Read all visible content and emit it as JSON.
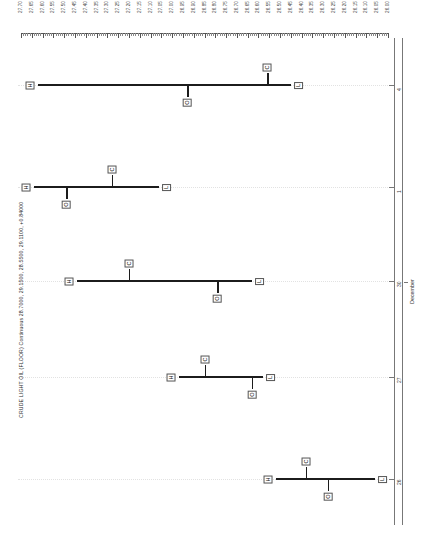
{
  "series_title": "CRUDE LIGHT OIL (FLOOR) Continuous 28.7000, 29.1500, 28.5500, 29.1100, +0.84000",
  "orientation": "rotated-90",
  "point_labels": {
    "high": "H",
    "open": "O",
    "close": "C",
    "low": "L"
  },
  "month_label": "December",
  "colors": {
    "bar": "#1c1c1c",
    "axis": "#555555",
    "grid": "#e2e2e2",
    "text": "#1a1a1a"
  },
  "chart_data": {
    "type": "bar",
    "subtype": "ohlc-bar-rotated",
    "title": "CRUDE LIGHT OIL (FLOOR) Continuous 28.7000, 29.1500, 28.5500, 29.1100, +0.84000",
    "xlabel": "",
    "ylabel": "",
    "grid": true,
    "legend": "none",
    "price_axis": {
      "position": "top",
      "direction": "descending-left-to-right",
      "ylim": [
        27.7,
        26.0
      ],
      "step": 0.05,
      "minor_ticks_per_major": 5,
      "tick_labels": [
        "27.70",
        "27.65",
        "27.60",
        "27.55",
        "27.50",
        "27.45",
        "27.40",
        "27.35",
        "27.30",
        "27.25",
        "27.20",
        "27.15",
        "27.10",
        "27.05",
        "27.00",
        "26.95",
        "26.90",
        "26.85",
        "26.80",
        "26.75",
        "26.70",
        "26.65",
        "26.60",
        "26.55",
        "26.50",
        "26.45",
        "26.40",
        "26.35",
        "26.30",
        "26.25",
        "26.20",
        "26.15",
        "26.10",
        "26.05",
        "26.00"
      ]
    },
    "date_axis": {
      "position": "right",
      "month": "December",
      "tick_labels": [
        "4",
        "1",
        "30",
        "27",
        "26"
      ]
    },
    "categories": [
      "4",
      "1",
      "30",
      "27",
      "26"
    ],
    "series": [
      {
        "name": "OHLC",
        "values": [
          {
            "date": "4",
            "high": 27.62,
            "open": 26.93,
            "close": 26.56,
            "low": 26.45
          },
          {
            "date": "1",
            "high": 27.64,
            "open": 27.49,
            "close": 27.28,
            "low": 27.06
          },
          {
            "date": "30",
            "high": 27.44,
            "open": 26.79,
            "close": 27.2,
            "low": 26.63
          },
          {
            "date": "27",
            "high": 26.97,
            "open": 26.63,
            "close": 26.85,
            "low": 26.58
          },
          {
            "date": "26",
            "high": 26.52,
            "open": 26.28,
            "close": 26.38,
            "low": 26.06
          }
        ]
      }
    ]
  }
}
